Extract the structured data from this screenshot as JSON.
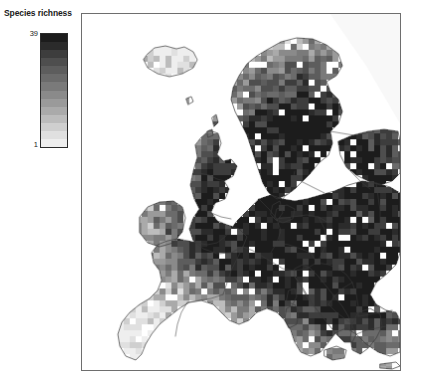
{
  "figure": {
    "width": 421,
    "height": 387,
    "background": "#ffffff"
  },
  "legend": {
    "title": "Species richness",
    "max_label": "39",
    "min_label": "1",
    "orientation": "vertical",
    "border_color": "#2b2b2b",
    "swatches": [
      "#1c1c1c",
      "#2b2b2b",
      "#3d3d3d",
      "#4e4e4e",
      "#5d5d5d",
      "#6b6b6b",
      "#7a7a7a",
      "#8a8a8a",
      "#9a9a9a",
      "#aaaaaa",
      "#bcbcbc",
      "#cfcfcf",
      "#e0e0e0",
      "#eeeeee"
    ]
  },
  "map": {
    "frame_color": "#6e6e6e",
    "ocean_color": "#ffffff",
    "border_color": "#3a3a3a",
    "cell_size": 6,
    "region": "Europe",
    "projection": "equal-area gridded raster",
    "value_min": 1,
    "value_max": 39,
    "nodata_color": "#ffffff"
  },
  "chart_data": {
    "type": "heatmap",
    "title": "Species richness",
    "xlabel": "",
    "ylabel": "",
    "legend_position": "left",
    "grid": false,
    "colorbar": {
      "label": "Species richness",
      "min": 1,
      "max": 39,
      "ticks": [
        1,
        39
      ],
      "scale": "grayscale-inverted",
      "n_classes": 14
    },
    "cell_size_px": 6,
    "value_range": [
      1,
      39
    ],
    "regional_summary": [
      {
        "region": "Fennoscandia (Norway/Sweden)",
        "typical_value": 22,
        "range": [
          10,
          34
        ]
      },
      {
        "region": "Finland / Karelia",
        "typical_value": 20,
        "range": [
          8,
          30
        ]
      },
      {
        "region": "Baltic states / Belarus",
        "typical_value": 26,
        "range": [
          6,
          39
        ]
      },
      {
        "region": "Poland / Eastern Europe",
        "typical_value": 27,
        "range": [
          5,
          39
        ]
      },
      {
        "region": "Germany / Central Europe",
        "typical_value": 21,
        "range": [
          12,
          31
        ]
      },
      {
        "region": "France",
        "typical_value": 20,
        "range": [
          12,
          28
        ]
      },
      {
        "region": "Iberian Peninsula",
        "typical_value": 16,
        "range": [
          5,
          26
        ]
      },
      {
        "region": "Italy",
        "typical_value": 17,
        "range": [
          4,
          28
        ]
      },
      {
        "region": "Balkans",
        "typical_value": 22,
        "range": [
          6,
          36
        ]
      },
      {
        "region": "British Isles",
        "typical_value": 14,
        "range": [
          6,
          22
        ]
      },
      {
        "region": "Iceland",
        "typical_value": 6,
        "range": [
          2,
          12
        ]
      },
      {
        "region": "Ukraine / SW Russia",
        "typical_value": 24,
        "range": [
          4,
          39
        ]
      }
    ]
  }
}
